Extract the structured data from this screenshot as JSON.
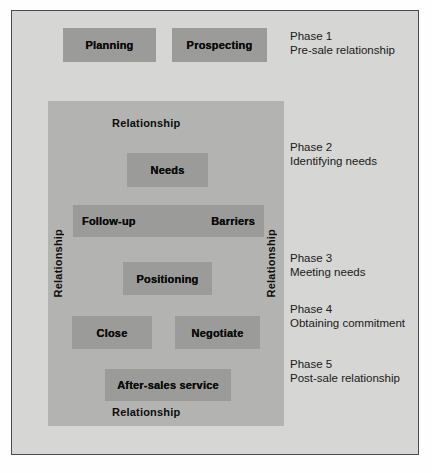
{
  "diagram": {
    "title_visible": false,
    "colors": {
      "page_background": "#fefefe",
      "frame_background": "#d6d6d4",
      "frame_border": "#4b4b4b",
      "relationship_panel": "#b3b3b1",
      "node_fill": "#9b9b99",
      "text": "#0d0d0d"
    },
    "pre_sale_nodes": [
      {
        "label": "Planning"
      },
      {
        "label": "Prospecting"
      }
    ],
    "relationship_panel": {
      "top_label": "Relationship",
      "bottom_label": "Relationship",
      "left_label": "Relationship",
      "right_label": "Relationship",
      "nodes": [
        {
          "label": "Needs"
        },
        {
          "label_left": "Follow-up",
          "label_right": "Barriers"
        },
        {
          "label": "Positioning"
        },
        {
          "label": "Close"
        },
        {
          "label": "Negotiate"
        },
        {
          "label": "After-sales service"
        }
      ]
    },
    "phases": [
      {
        "title": "Phase 1",
        "subtitle": "Pre-sale relationship"
      },
      {
        "title": "Phase 2",
        "subtitle": "Identifying needs"
      },
      {
        "title": "Phase 3",
        "subtitle": "Meeting needs"
      },
      {
        "title": "Phase 4",
        "subtitle": "Obtaining commitment"
      },
      {
        "title": "Phase 5",
        "subtitle": "Post-sale relationship"
      }
    ]
  }
}
